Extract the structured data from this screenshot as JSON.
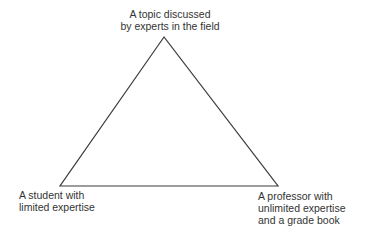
{
  "diagram": {
    "type": "triangle",
    "stroke_color": "#3a3a3a",
    "vertices": {
      "top": {
        "x": 164,
        "y": 37,
        "label_lines": [
          "A topic discussed",
          "by experts in the field"
        ]
      },
      "bottom_left": {
        "x": 60,
        "y": 186,
        "label_lines": [
          "A student with",
          "limited expertise"
        ]
      },
      "bottom_right": {
        "x": 278,
        "y": 186,
        "label_lines": [
          "A professor with",
          "unlimited expertise",
          "and a grade book"
        ]
      }
    }
  }
}
